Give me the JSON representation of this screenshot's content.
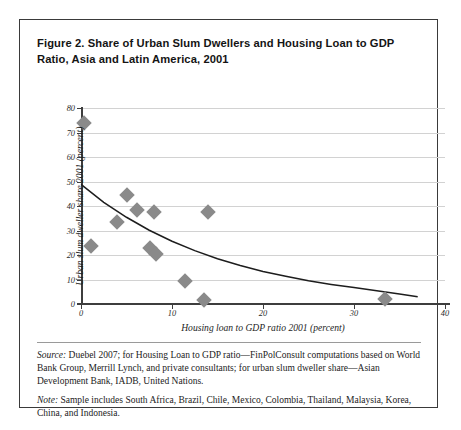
{
  "figure": {
    "title": "Figure 2. Share of Urban Slum Dwellers and Housing Loan to GDP Ratio, Asia and Latin America, 2001",
    "source_lead": "Source:",
    "source_text": " Duebel 2007; for Housing Loan to GDP ratio—FinPolConsult computations based on World Bank Group, Merrill Lynch, and private consultants; for urban slum dweller share—Asian Development Bank, IADB, United Nations.",
    "note_lead": "Note:",
    "note_text": " Sample includes South Africa, Brazil, Chile, Mexico, Colombia, Thailand, Malaysia, Korea, China, and Indonesia."
  },
  "chart_data": {
    "type": "scatter",
    "title": "Figure 2. Share of Urban Slum Dwellers and Housing Loan to GDP Ratio, Asia and Latin America, 2001",
    "xlabel": "Housing loan to GDP ratio 2001 (percent)",
    "ylabel": "Urban slum dweller share 2001 (percent)",
    "xlim": [
      0,
      40
    ],
    "ylim": [
      0,
      80
    ],
    "xticks": [
      0,
      10,
      20,
      30,
      40
    ],
    "yticks": [
      0,
      10,
      20,
      30,
      40,
      50,
      60,
      70,
      80
    ],
    "xtick_labels": [
      "0",
      "10",
      "20",
      "30",
      "40"
    ],
    "ytick_labels": [
      "0",
      "10",
      "20",
      "30",
      "40",
      "50",
      "60",
      "70",
      "80"
    ],
    "grid": "horizontal",
    "legend": "none",
    "marker": {
      "shape": "diamond",
      "color": "#8a8a8a",
      "size": 11
    },
    "points": [
      {
        "x": 0.3,
        "y": 74.0
      },
      {
        "x": 1.1,
        "y": 23.5
      },
      {
        "x": 4.0,
        "y": 33.5
      },
      {
        "x": 5.1,
        "y": 44.3
      },
      {
        "x": 6.2,
        "y": 38.3
      },
      {
        "x": 7.6,
        "y": 22.7
      },
      {
        "x": 8.0,
        "y": 37.6
      },
      {
        "x": 8.2,
        "y": 20.3
      },
      {
        "x": 11.4,
        "y": 9.3
      },
      {
        "x": 13.5,
        "y": 1.8
      },
      {
        "x": 14.0,
        "y": 37.5
      },
      {
        "x": 33.4,
        "y": 2.2
      }
    ],
    "trendline": {
      "type": "exponential",
      "label": "fitted decay curve",
      "color": "#1d1d1d",
      "points": [
        {
          "x": 0.0,
          "y": 48.8
        },
        {
          "x": 2.5,
          "y": 41.5
        },
        {
          "x": 5.0,
          "y": 35.4
        },
        {
          "x": 7.5,
          "y": 30.1
        },
        {
          "x": 10.0,
          "y": 25.6
        },
        {
          "x": 12.5,
          "y": 21.8
        },
        {
          "x": 15.0,
          "y": 18.5
        },
        {
          "x": 17.5,
          "y": 15.7
        },
        {
          "x": 20.0,
          "y": 13.3
        },
        {
          "x": 22.5,
          "y": 11.3
        },
        {
          "x": 25.0,
          "y": 9.5
        },
        {
          "x": 27.5,
          "y": 8.0
        },
        {
          "x": 30.0,
          "y": 6.7
        },
        {
          "x": 32.5,
          "y": 5.4
        },
        {
          "x": 35.0,
          "y": 4.1
        },
        {
          "x": 37.0,
          "y": 3.0
        }
      ]
    }
  }
}
